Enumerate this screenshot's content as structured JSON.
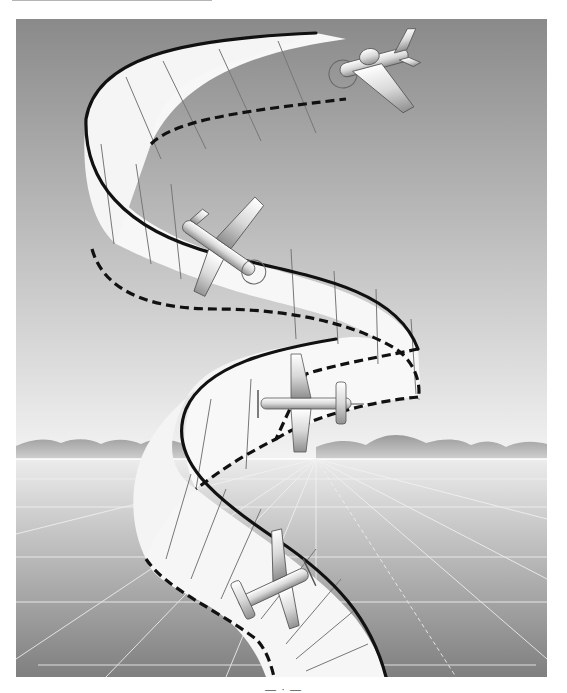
{
  "illustration": {
    "subject": "Aerobatic airplane maneuver drawn along a spiraling ribbon path over a flat landscape",
    "scene": {
      "sky_top_color": "#8a8a8a",
      "sky_horizon_color": "#f3f3f3",
      "mountains_color": "#a9a9a9",
      "ground_horizon_color": "#ececec",
      "ground_bottom_color": "#7f7f7f",
      "ribbon_fill": "#f6f6f6",
      "ribbon_edge_color": "#111111"
    },
    "airplanes": [
      {
        "position": "top",
        "attitude": "banking left toward viewer"
      },
      {
        "position": "upper-middle",
        "attitude": "rolled, nose pointing down-right"
      },
      {
        "position": "middle",
        "attitude": "top view, flying left"
      },
      {
        "position": "bottom",
        "attitude": "climbing, nose pointing up-right"
      }
    ]
  },
  "caption": {
    "text": "— · —"
  }
}
